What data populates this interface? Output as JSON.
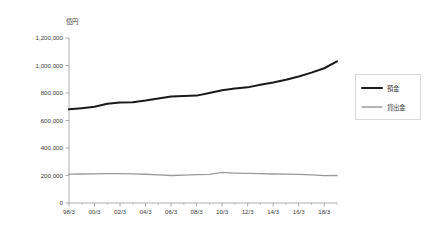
{
  "chart_data": {
    "type": "line",
    "title": "",
    "unit_label": "億円",
    "xlabel": "",
    "ylabel": "",
    "ylim": [
      0,
      1200000
    ],
    "ytick_labels": [
      "0",
      "200,000",
      "400,000",
      "600,000",
      "800,000",
      "1,000,000",
      "1,200,000"
    ],
    "ytick_values": [
      0,
      200000,
      400000,
      600000,
      800000,
      1000000,
      1200000
    ],
    "grid": false,
    "legend_position": "right",
    "categories": [
      "98/3",
      "99/3",
      "00/3",
      "01/3",
      "02/3",
      "03/3",
      "04/3",
      "05/3",
      "06/3",
      "07/3",
      "08/3",
      "09/3",
      "10/3",
      "11/3",
      "12/3",
      "13/3",
      "14/3",
      "15/3",
      "16/3",
      "17/3",
      "18/3",
      "19/3"
    ],
    "xtick_labels_shown": [
      "98/3",
      "00/3",
      "02/3",
      "04/3",
      "06/3",
      "08/3",
      "10/3",
      "12/3",
      "14/3",
      "16/3",
      "18/3"
    ],
    "series": [
      {
        "name": "預金",
        "color": "#1a1a1a",
        "width": 2.0,
        "values": [
          681000,
          690000,
          700000,
          722000,
          731000,
          733000,
          745000,
          760000,
          775000,
          779000,
          781000,
          800000,
          820000,
          833000,
          841000,
          860000,
          877000,
          897000,
          920000,
          948000,
          980000,
          1030000
        ]
      },
      {
        "name": "貸出金",
        "color": "#9a9a9a",
        "width": 1.3,
        "values": [
          210000,
          211000,
          212000,
          213000,
          214000,
          212000,
          209000,
          205000,
          200000,
          202000,
          206000,
          208000,
          223000,
          218000,
          215000,
          213000,
          211000,
          210000,
          208000,
          205000,
          199000,
          200000
        ]
      }
    ]
  },
  "legend": {
    "items": [
      {
        "label": "預金"
      },
      {
        "label": "貸出金"
      }
    ]
  }
}
